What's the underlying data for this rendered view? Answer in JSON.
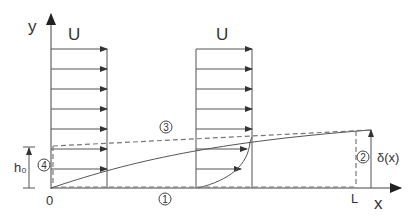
{
  "diagram": {
    "axes": {
      "y_label": "y",
      "x_label": "x",
      "origin_label": "0",
      "length_label": "L"
    },
    "profiles": [
      {
        "label": "U",
        "type": "uniform"
      },
      {
        "label": "U",
        "type": "boundary-layer"
      }
    ],
    "annotations": {
      "h0": "h₀",
      "delta": "δ(x)",
      "region_1": "1",
      "region_2": "2",
      "region_3": "3",
      "region_4": "4"
    },
    "colors": {
      "line": "#555555",
      "dashed": "#777777",
      "text": "#333333"
    }
  }
}
